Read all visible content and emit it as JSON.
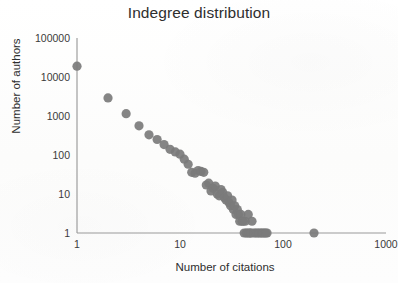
{
  "chart_data": {
    "type": "scatter",
    "title": "Indegree distribution",
    "xlabel": "Number of citations",
    "ylabel": "Number of authors",
    "xscale": "log",
    "yscale": "log",
    "xlim": [
      1,
      1000
    ],
    "ylim": [
      1,
      100000
    ],
    "grid": false,
    "legend": null,
    "marker": {
      "shape": "circle",
      "color": "#7b7b7b",
      "size": 5.2
    },
    "xticks": [
      "1",
      "10",
      "100",
      "1000"
    ],
    "xtick_values": [
      1,
      10,
      100,
      1000
    ],
    "yticks": [
      "1",
      "10",
      "100",
      "1000",
      "10000",
      "100000"
    ],
    "ytick_values": [
      1,
      10,
      100,
      1000,
      10000,
      100000
    ],
    "series": [
      {
        "name": "indegree",
        "points": [
          [
            1,
            19000
          ],
          [
            2,
            2900
          ],
          [
            3,
            1150
          ],
          [
            4,
            560
          ],
          [
            5,
            330
          ],
          [
            6,
            250
          ],
          [
            7,
            185
          ],
          [
            8,
            140
          ],
          [
            9,
            120
          ],
          [
            10,
            105
          ],
          [
            11,
            78
          ],
          [
            12,
            58
          ],
          [
            13,
            36
          ],
          [
            14,
            34
          ],
          [
            15,
            40
          ],
          [
            16,
            38
          ],
          [
            17,
            36
          ],
          [
            18,
            17
          ],
          [
            19,
            19
          ],
          [
            20,
            12
          ],
          [
            21,
            14
          ],
          [
            22,
            16
          ],
          [
            23,
            10
          ],
          [
            24,
            9
          ],
          [
            25,
            13
          ],
          [
            26,
            11
          ],
          [
            27,
            8
          ],
          [
            28,
            7
          ],
          [
            29,
            9
          ],
          [
            30,
            6
          ],
          [
            31,
            5
          ],
          [
            32,
            7
          ],
          [
            33,
            4
          ],
          [
            34,
            5
          ],
          [
            35,
            3
          ],
          [
            36,
            4
          ],
          [
            37,
            3
          ],
          [
            38,
            2
          ],
          [
            39,
            3
          ],
          [
            40,
            2
          ],
          [
            41,
            2
          ],
          [
            42,
            1
          ],
          [
            43,
            2
          ],
          [
            44,
            1
          ],
          [
            45,
            1
          ],
          [
            46,
            3
          ],
          [
            47,
            1
          ],
          [
            48,
            1
          ],
          [
            49,
            1
          ],
          [
            50,
            2
          ],
          [
            52,
            1
          ],
          [
            54,
            1
          ],
          [
            56,
            1
          ],
          [
            58,
            1
          ],
          [
            60,
            1
          ],
          [
            62,
            1
          ],
          [
            64,
            1
          ],
          [
            66,
            1
          ],
          [
            68,
            1
          ],
          [
            70,
            1
          ],
          [
            200,
            1
          ]
        ]
      }
    ]
  }
}
